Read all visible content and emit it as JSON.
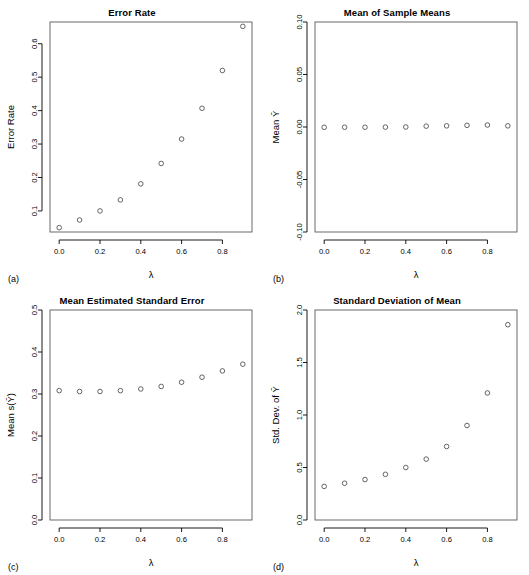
{
  "figure": {
    "background_color": "#ffffff",
    "point_color": "#4a4a4a",
    "frame_color": "#5a5a5a",
    "layout": "2x2 grid of scatter panels"
  },
  "panels": [
    {
      "tag": "(a)",
      "title": "Error Rate",
      "xlabel": "λ",
      "ylabel": "Error Rate",
      "x_ticks": [
        "0.0",
        "0.2",
        "0.4",
        "0.6",
        "0.8"
      ],
      "y_ticks": [
        "0.1",
        "0.2",
        "0.3",
        "0.4",
        "0.5",
        "0.6"
      ]
    },
    {
      "tag": "(b)",
      "title": "Mean of Sample Means",
      "xlabel": "λ",
      "ylabel": "Mean Ȳ",
      "x_ticks": [
        "0.0",
        "0.2",
        "0.4",
        "0.6",
        "0.8"
      ],
      "y_ticks": [
        "-0.10",
        "-0.05",
        "0.00",
        "0.05",
        "0.10"
      ]
    },
    {
      "tag": "(c)",
      "title": "Mean Estimated Standard Error",
      "xlabel": "λ",
      "ylabel": "Mean s(Ȳ)",
      "x_ticks": [
        "0.0",
        "0.2",
        "0.4",
        "0.6",
        "0.8"
      ],
      "y_ticks": [
        "0.0",
        "0.1",
        "0.2",
        "0.3",
        "0.4",
        "0.5"
      ]
    },
    {
      "tag": "(d)",
      "title": "Standard Deviation of Mean",
      "xlabel": "λ",
      "ylabel": "Std. Dev. of Ȳ",
      "x_ticks": [
        "0.0",
        "0.2",
        "0.4",
        "0.6",
        "0.8"
      ],
      "y_ticks": [
        "0.0",
        "0.5",
        "1.0",
        "1.5",
        "2.0"
      ]
    }
  ],
  "chart_data": [
    {
      "type": "scatter",
      "panel": "(a)",
      "title": "Error Rate",
      "xlabel": "λ",
      "ylabel": "Error Rate",
      "x": [
        0.0,
        0.1,
        0.2,
        0.3,
        0.4,
        0.5,
        0.6,
        0.7,
        0.8,
        0.9
      ],
      "values": [
        0.05,
        0.073,
        0.1,
        0.133,
        0.181,
        0.242,
        0.315,
        0.407,
        0.52,
        0.652
      ],
      "xlim": [
        -0.045,
        0.945
      ],
      "ylim": [
        0.037,
        0.665
      ],
      "x_ticks": [
        0.0,
        0.2,
        0.4,
        0.6,
        0.8
      ],
      "y_ticks": [
        0.1,
        0.2,
        0.3,
        0.4,
        0.5,
        0.6
      ],
      "grid": false,
      "legend": null
    },
    {
      "type": "scatter",
      "panel": "(b)",
      "title": "Mean of Sample Means",
      "xlabel": "λ",
      "ylabel": "Mean Ȳ",
      "x": [
        0.0,
        0.1,
        0.2,
        0.3,
        0.4,
        0.5,
        0.6,
        0.7,
        0.8,
        0.9
      ],
      "values": [
        -0.0003,
        -0.0002,
        -0.0002,
        -0.0001,
        0.0,
        0.0008,
        0.0011,
        0.0016,
        0.0019,
        0.0011
      ],
      "xlim": [
        -0.045,
        0.945
      ],
      "ylim": [
        -0.1,
        0.1
      ],
      "x_ticks": [
        0.0,
        0.2,
        0.4,
        0.6,
        0.8
      ],
      "y_ticks": [
        -0.1,
        -0.05,
        0.0,
        0.05,
        0.1
      ],
      "grid": false,
      "legend": null
    },
    {
      "type": "scatter",
      "panel": "(c)",
      "title": "Mean Estimated Standard Error",
      "xlabel": "λ",
      "ylabel": "Mean s(Ȳ)",
      "x": [
        0.0,
        0.1,
        0.2,
        0.3,
        0.4,
        0.5,
        0.6,
        0.7,
        0.8,
        0.9
      ],
      "values": [
        0.308,
        0.306,
        0.306,
        0.308,
        0.312,
        0.318,
        0.328,
        0.34,
        0.355,
        0.371
      ],
      "xlim": [
        -0.045,
        0.945
      ],
      "ylim": [
        0.0,
        0.5
      ],
      "x_ticks": [
        0.0,
        0.2,
        0.4,
        0.6,
        0.8
      ],
      "y_ticks": [
        0.0,
        0.1,
        0.2,
        0.3,
        0.4,
        0.5
      ],
      "grid": false,
      "legend": null
    },
    {
      "type": "scatter",
      "panel": "(d)",
      "title": "Standard Deviation of Mean",
      "xlabel": "λ",
      "ylabel": "Std. Dev. of Ȳ",
      "x": [
        0.0,
        0.1,
        0.2,
        0.3,
        0.4,
        0.5,
        0.6,
        0.7,
        0.8,
        0.9
      ],
      "values": [
        0.32,
        0.35,
        0.385,
        0.435,
        0.5,
        0.58,
        0.7,
        0.9,
        1.21,
        1.86
      ],
      "xlim": [
        -0.045,
        0.945
      ],
      "ylim": [
        0.0,
        2.0
      ],
      "x_ticks": [
        0.0,
        0.2,
        0.4,
        0.6,
        0.8
      ],
      "y_ticks": [
        0.0,
        0.5,
        1.0,
        1.5,
        2.0
      ],
      "grid": false,
      "legend": null
    }
  ]
}
